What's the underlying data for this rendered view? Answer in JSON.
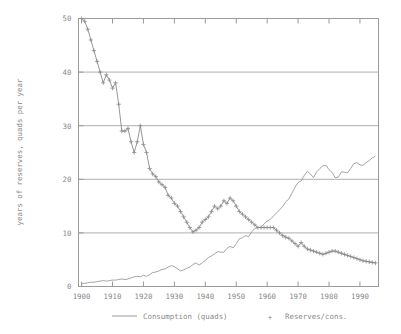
{
  "chart_data": {
    "type": "line",
    "title": "",
    "subtitle": "",
    "xlabel": "",
    "ylabel": "years of reserves, quads per year",
    "xlim": [
      1899,
      1996
    ],
    "ylim": [
      0,
      50
    ],
    "grid": true,
    "grid_axis": "y",
    "legend_position": "bottom-center",
    "xticks": [
      1900,
      1910,
      1920,
      1930,
      1940,
      1950,
      1960,
      1970,
      1980,
      1990
    ],
    "xtick_labels": [
      "1900",
      "1910",
      "1920",
      "1930",
      "1940",
      "1950",
      "1960",
      "1970",
      "1980",
      "1990"
    ],
    "yticks": [
      0,
      10,
      20,
      30,
      40,
      50
    ],
    "ytick_labels": [
      "0",
      "10",
      "20",
      "30",
      "40",
      "50"
    ],
    "series": [
      {
        "name": "Consumption (quads)",
        "marker": "none",
        "style": "line",
        "color": "#9a9a9a",
        "x": [
          1900,
          1901,
          1902,
          1903,
          1904,
          1905,
          1906,
          1907,
          1908,
          1909,
          1910,
          1911,
          1912,
          1913,
          1914,
          1915,
          1916,
          1917,
          1918,
          1919,
          1920,
          1921,
          1922,
          1923,
          1924,
          1925,
          1926,
          1927,
          1928,
          1929,
          1930,
          1931,
          1932,
          1933,
          1934,
          1935,
          1936,
          1937,
          1938,
          1939,
          1940,
          1941,
          1942,
          1943,
          1944,
          1945,
          1946,
          1947,
          1948,
          1949,
          1950,
          1951,
          1952,
          1953,
          1954,
          1955,
          1956,
          1957,
          1958,
          1959,
          1960,
          1961,
          1962,
          1963,
          1964,
          1965,
          1966,
          1967,
          1968,
          1969,
          1970,
          1971,
          1972,
          1973,
          1974,
          1975,
          1976,
          1977,
          1978,
          1979,
          1980,
          1981,
          1982,
          1983,
          1984,
          1985,
          1986,
          1987,
          1988,
          1989,
          1990,
          1991,
          1992,
          1993,
          1994,
          1995
        ],
        "values": [
          0.5,
          0.6,
          0.7,
          0.8,
          0.8,
          0.9,
          1.0,
          1.1,
          1.0,
          1.1,
          1.2,
          1.2,
          1.3,
          1.4,
          1.3,
          1.4,
          1.6,
          1.8,
          1.9,
          1.8,
          2.1,
          1.9,
          2.2,
          2.6,
          2.7,
          2.9,
          3.2,
          3.3,
          3.6,
          3.9,
          3.7,
          3.3,
          2.9,
          3.1,
          3.4,
          3.6,
          4.1,
          4.4,
          4.0,
          4.4,
          4.9,
          5.4,
          5.7,
          6.1,
          6.5,
          6.4,
          6.4,
          7.1,
          7.5,
          7.2,
          8.0,
          8.9,
          9.1,
          9.5,
          9.3,
          10.2,
          10.8,
          11.0,
          11.0,
          11.7,
          12.2,
          12.5,
          13.1,
          13.7,
          14.3,
          14.9,
          15.8,
          16.3,
          17.4,
          18.5,
          19.4,
          19.7,
          20.7,
          21.5,
          21.0,
          20.3,
          21.4,
          22.0,
          22.5,
          22.6,
          21.8,
          21.3,
          20.3,
          20.4,
          21.4,
          21.3,
          21.2,
          22.0,
          22.9,
          23.1,
          22.7,
          22.6,
          23.1,
          23.5,
          24.0,
          24.3
        ]
      },
      {
        "name": "Reserves/cons.",
        "marker": "plus",
        "style": "line+marker",
        "color": "#8a8a8a",
        "x": [
          1900,
          1901,
          1902,
          1903,
          1904,
          1905,
          1906,
          1907,
          1908,
          1909,
          1910,
          1911,
          1912,
          1913,
          1914,
          1915,
          1916,
          1917,
          1918,
          1919,
          1920,
          1921,
          1922,
          1923,
          1924,
          1925,
          1926,
          1927,
          1928,
          1929,
          1930,
          1931,
          1932,
          1933,
          1934,
          1935,
          1936,
          1937,
          1938,
          1939,
          1940,
          1941,
          1942,
          1943,
          1944,
          1945,
          1946,
          1947,
          1948,
          1949,
          1950,
          1951,
          1952,
          1953,
          1954,
          1955,
          1956,
          1957,
          1958,
          1959,
          1960,
          1961,
          1962,
          1963,
          1964,
          1965,
          1966,
          1967,
          1968,
          1969,
          1970,
          1971,
          1972,
          1973,
          1974,
          1975,
          1976,
          1977,
          1978,
          1979,
          1980,
          1981,
          1982,
          1983,
          1984,
          1985,
          1986,
          1987,
          1988,
          1989,
          1990,
          1991,
          1992,
          1993,
          1994,
          1995
        ],
        "values": [
          50.0,
          49.5,
          48.0,
          46.0,
          44.0,
          42.0,
          40.0,
          38.0,
          39.5,
          38.5,
          37.0,
          38.0,
          34.0,
          29.0,
          29.0,
          29.5,
          27.0,
          25.0,
          27.0,
          30.0,
          26.5,
          25.0,
          22.0,
          21.0,
          20.5,
          19.5,
          19.0,
          18.5,
          17.0,
          16.5,
          15.5,
          15.0,
          14.0,
          13.0,
          12.0,
          11.0,
          10.2,
          10.5,
          11.0,
          12.0,
          12.5,
          13.0,
          14.0,
          15.0,
          14.5,
          15.0,
          16.0,
          15.5,
          16.5,
          16.0,
          15.0,
          14.0,
          13.5,
          13.0,
          12.5,
          12.0,
          11.5,
          11.0,
          11.0,
          11.0,
          11.0,
          11.0,
          11.0,
          10.5,
          10.0,
          9.5,
          9.2,
          9.0,
          8.5,
          8.0,
          7.5,
          8.2,
          7.5,
          7.0,
          6.8,
          6.6,
          6.4,
          6.2,
          6.0,
          6.2,
          6.4,
          6.6,
          6.6,
          6.4,
          6.2,
          6.0,
          5.8,
          5.6,
          5.4,
          5.2,
          5.0,
          4.8,
          4.7,
          4.6,
          4.5,
          4.4
        ]
      }
    ]
  },
  "axis": {
    "ylabel": "years of reserves, quads per year"
  },
  "legend": {
    "items": [
      {
        "label": "Consumption (quads)",
        "marker": "line"
      },
      {
        "label": "Reserves/cons.",
        "marker": "plus"
      }
    ]
  },
  "colors": {
    "line": "#9a9a9a",
    "grid": "#b0b0b0",
    "frame": "#9a9a9a",
    "text": "#8a8a8a",
    "background": "#ffffff"
  }
}
